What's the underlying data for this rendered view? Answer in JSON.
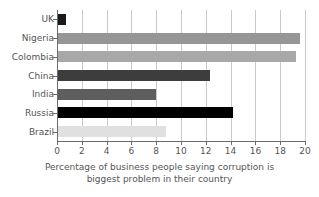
{
  "chart_data": {
    "type": "bar",
    "orientation": "horizontal",
    "title": "",
    "xlabel_line1": "Percentage of business people saying corruption is",
    "xlabel_line2": "biggest problem in their country",
    "ylabel": "",
    "xlim": [
      0,
      20
    ],
    "xticks": [
      0,
      2,
      4,
      6,
      8,
      10,
      12,
      14,
      16,
      18,
      20
    ],
    "xtick_labels": [
      "0",
      "2",
      "4",
      "6",
      "8",
      "10",
      "12",
      "14",
      "16",
      "18",
      "20"
    ],
    "grid": "vertical",
    "legend": "none",
    "categories": [
      "UK",
      "Nigeria",
      "Colombia",
      "China",
      "India",
      "Russia",
      "Brazil"
    ],
    "values": [
      0.7,
      19.6,
      19.3,
      12.3,
      8.0,
      14.2,
      8.8
    ],
    "bar_colors": [
      "#1a1a1a",
      "#969696",
      "#a8a8a8",
      "#3d3d3d",
      "#5e5e5e",
      "#000000",
      "#e0e0e0"
    ],
    "bars": [
      {
        "category": "UK",
        "value": 0.7,
        "color": "#1a1a1a"
      },
      {
        "category": "Nigeria",
        "value": 19.6,
        "color": "#969696"
      },
      {
        "category": "Colombia",
        "value": 19.3,
        "color": "#a8a8a8"
      },
      {
        "category": "China",
        "value": 12.3,
        "color": "#3d3d3d"
      },
      {
        "category": "India",
        "value": 8.0,
        "color": "#5e5e5e"
      },
      {
        "category": "Russia",
        "value": 14.2,
        "color": "#000000"
      },
      {
        "category": "Brazil",
        "value": 8.8,
        "color": "#e0e0e0"
      }
    ],
    "axis_color": "#6b6b6b",
    "grid_color": "#c9c9c9",
    "text_color": "#555555",
    "background": "#ffffff"
  }
}
